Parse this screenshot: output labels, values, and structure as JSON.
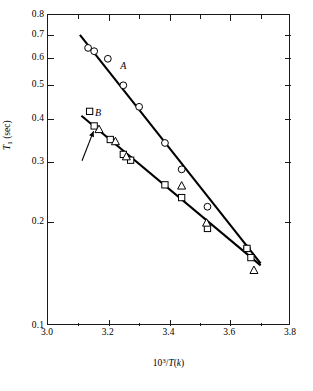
{
  "chart_data": {
    "type": "scatter",
    "title": "",
    "xlabel": "10^3/T(k)",
    "ylabel": "T_1 (sec)",
    "xlabel_html": "10<sup>3</sup>/<i>T</i>(<i>k</i>)",
    "ylabel_html": "<i>T</i><sub>1</sub> (sec)",
    "yscale": "log",
    "xscale": "linear",
    "xlim": [
      3.0,
      3.8
    ],
    "ylim": [
      0.1,
      0.8
    ],
    "grid": false,
    "legend": "none",
    "xticks": [
      3.0,
      3.2,
      3.4,
      3.6,
      3.8
    ],
    "xticklabels": [
      "3.0",
      "3.2",
      "3.4",
      "3.6",
      "3.8"
    ],
    "xminorticks": [
      3.1,
      3.3,
      3.5,
      3.7
    ],
    "yticks": [
      0.1,
      0.2,
      0.3,
      0.4,
      0.5,
      0.6,
      0.7,
      0.8
    ],
    "yticklabels": [
      "0.1",
      "0.2",
      "0.3",
      "0.4",
      "0.5",
      "0.6",
      "0.7",
      "0.8"
    ],
    "series": [
      {
        "name": "A",
        "label": "A",
        "marker": "circle",
        "color": "#000000",
        "points": [
          {
            "x": 3.132,
            "y": 0.642
          },
          {
            "x": 3.152,
            "y": 0.628
          },
          {
            "x": 3.197,
            "y": 0.597
          },
          {
            "x": 3.248,
            "y": 0.5
          },
          {
            "x": 3.3,
            "y": 0.433
          },
          {
            "x": 3.385,
            "y": 0.34
          },
          {
            "x": 3.44,
            "y": 0.285
          },
          {
            "x": 3.525,
            "y": 0.222
          },
          {
            "x": 3.655,
            "y": 0.168
          }
        ],
        "fit_line": {
          "x": [
            3.105,
            3.7
          ],
          "y": [
            0.7,
            0.152
          ]
        }
      },
      {
        "name": "B",
        "label": "B",
        "marker": "square",
        "color": "#000000",
        "points": [
          {
            "x": 3.137,
            "y": 0.42
          },
          {
            "x": 3.152,
            "y": 0.381
          },
          {
            "x": 3.205,
            "y": 0.348
          },
          {
            "x": 3.248,
            "y": 0.315
          },
          {
            "x": 3.272,
            "y": 0.303
          },
          {
            "x": 3.385,
            "y": 0.257
          },
          {
            "x": 3.44,
            "y": 0.236
          },
          {
            "x": 3.525,
            "y": 0.192
          },
          {
            "x": 3.655,
            "y": 0.168
          },
          {
            "x": 3.668,
            "y": 0.158
          }
        ],
        "fit_line": {
          "x": [
            3.11,
            3.7
          ],
          "y": [
            0.408,
            0.15
          ]
        }
      },
      {
        "name": "B-triangles",
        "label": "",
        "marker": "triangle",
        "color": "#000000",
        "points": [
          {
            "x": 3.168,
            "y": 0.372
          },
          {
            "x": 3.222,
            "y": 0.343
          },
          {
            "x": 3.258,
            "y": 0.31
          },
          {
            "x": 3.44,
            "y": 0.255
          },
          {
            "x": 3.522,
            "y": 0.199
          },
          {
            "x": 3.678,
            "y": 0.145
          }
        ]
      }
    ],
    "annotations": [
      {
        "text": "A",
        "x": 3.241,
        "y": 0.545,
        "type": "series-label"
      },
      {
        "text": "B",
        "x": 3.158,
        "y": 0.4,
        "type": "series-label"
      },
      {
        "text": "",
        "type": "arrow",
        "tail_x": 3.112,
        "tail_y": 0.302,
        "head_x": 3.15,
        "head_y": 0.368
      }
    ]
  },
  "caption": {
    "text": ""
  }
}
